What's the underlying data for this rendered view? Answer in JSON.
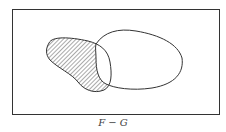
{
  "diagram": {
    "type": "venn",
    "caption": "F − G",
    "sets": [
      {
        "name": "F",
        "shaded": "region of F outside G"
      },
      {
        "name": "G",
        "shaded": false
      }
    ],
    "colors": {
      "stroke": "#333333",
      "hatch": "#555555",
      "background": "#ffffff"
    }
  }
}
